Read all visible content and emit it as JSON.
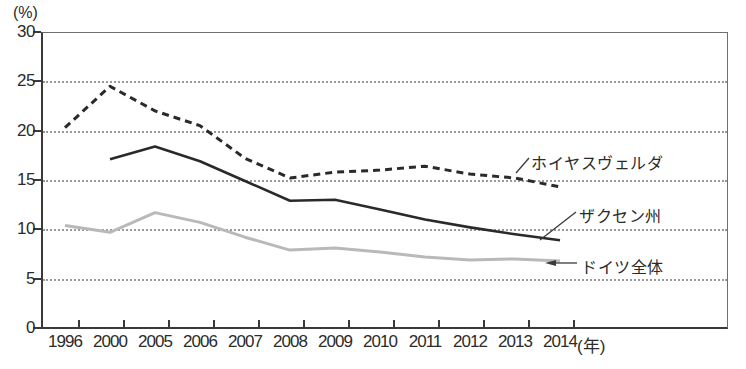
{
  "labels": {
    "unit_y": "(%)",
    "unit_x": "(年)"
  },
  "chart_data": {
    "type": "line",
    "title": "",
    "xlabel": "(年)",
    "ylabel": "(%)",
    "ylim": [
      0,
      30
    ],
    "yticks": [
      0,
      5,
      10,
      15,
      20,
      25,
      30
    ],
    "grid": "horizontal dotted gridlines at 5,10,15,20,25",
    "legend_position": "inline labels with leader lines at right of curves",
    "categories": [
      "1996",
      "2000",
      "2005",
      "2006",
      "2007",
      "2008",
      "2009",
      "2010",
      "2011",
      "2012",
      "2013",
      "2014"
    ],
    "series": [
      {
        "name": "ホイヤスヴェルダ",
        "style": "dashed",
        "color": "#2a2a2a",
        "values": [
          20.3,
          24.5,
          22.0,
          20.5,
          17.2,
          15.2,
          15.8,
          16.0,
          16.4,
          15.6,
          15.2,
          14.3
        ]
      },
      {
        "name": "ザクセン州",
        "style": "solid",
        "color": "#2a2a2a",
        "values": [
          null,
          17.1,
          18.4,
          16.9,
          14.9,
          12.9,
          13.0,
          12.0,
          11.0,
          10.2,
          9.5,
          8.9
        ]
      },
      {
        "name": "ドイツ全体",
        "style": "solid",
        "color": "#b9b9b9",
        "values": [
          10.4,
          9.7,
          11.7,
          10.7,
          9.2,
          7.9,
          8.1,
          7.7,
          7.2,
          6.9,
          7.0,
          6.8
        ]
      }
    ]
  }
}
